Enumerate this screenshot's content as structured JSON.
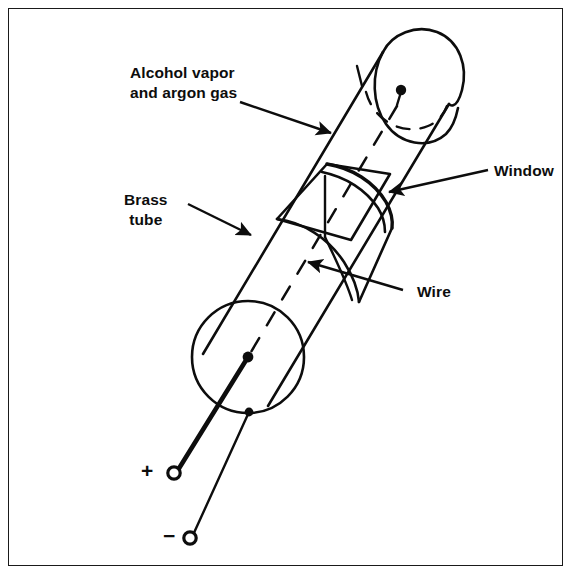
{
  "figure": {
    "background_color": "#ffffff",
    "ink_color": "#0d0d0d",
    "border_color": "#1a1a1a",
    "width": 573,
    "height": 576
  },
  "labels": {
    "alcohol": {
      "line1": "Alcohol vapor",
      "line2": "and argon gas",
      "text": "Alcohol vapor\nand argon gas"
    },
    "brass": {
      "line1": "Brass",
      "line2": "tube",
      "text": "Brass\ntube"
    },
    "window": {
      "text": "Window"
    },
    "wire": {
      "text": "Wire"
    }
  },
  "terminals": {
    "positive": {
      "sign": "+",
      "name": "positive-terminal"
    },
    "negative": {
      "sign": "−",
      "name": "negative-terminal"
    }
  },
  "parts": {
    "tube": "brass-tube-body",
    "top_cap": "domed-end-cap",
    "bottom_cap": "circular-end-cap",
    "window": "mica-window-cutout",
    "wire": "central-anode-wire"
  }
}
